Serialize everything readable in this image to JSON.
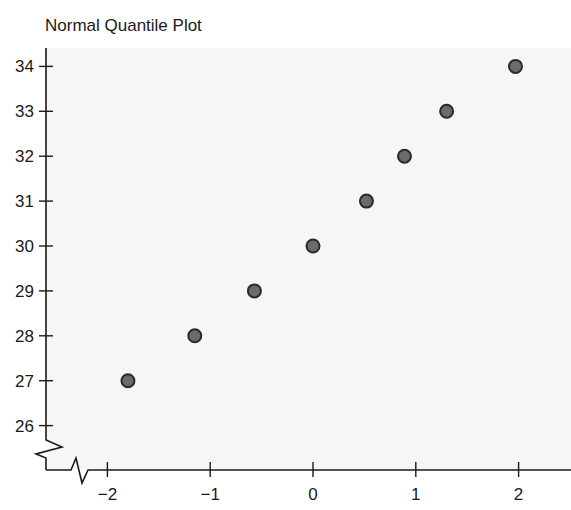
{
  "chart_data": {
    "type": "scatter",
    "title": "Normal Quantile Plot",
    "xlabel": "",
    "ylabel": "",
    "x": [
      -1.8,
      -1.15,
      -0.57,
      0.0,
      0.52,
      0.89,
      1.3,
      1.97
    ],
    "y": [
      27,
      28,
      29,
      30,
      31,
      32,
      33,
      34
    ],
    "x_ticks": [
      -2,
      -1,
      0,
      1,
      2
    ],
    "x_tick_labels": [
      "−2",
      "−1",
      "0",
      "1",
      "2"
    ],
    "y_ticks": [
      26,
      27,
      28,
      29,
      30,
      31,
      32,
      33,
      34
    ],
    "y_tick_labels": [
      "26",
      "27",
      "28",
      "29",
      "30",
      "31",
      "32",
      "33",
      "34"
    ],
    "xlim": [
      -2.6,
      2.5
    ],
    "ylim": [
      25.1,
      34.2
    ],
    "grid": false,
    "legend": null,
    "axis_breaks": [
      "y-axis below 26",
      "x-axis left of -2"
    ],
    "marker_color": "#6b6b6b",
    "marker_edge_color": "#2a2a2a",
    "background_color": "#f6f6f6"
  }
}
